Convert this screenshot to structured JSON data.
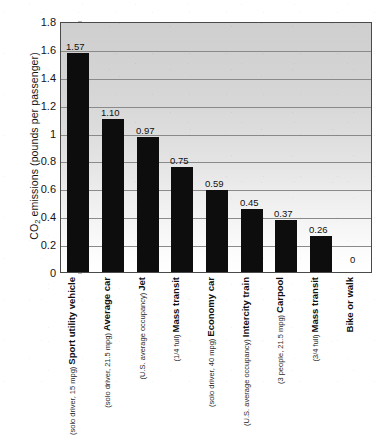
{
  "chart_data": {
    "type": "bar",
    "title": "",
    "subtitle": "",
    "xlabel": "",
    "ylabel": "CO2 emissions (pounds per passenger)",
    "ylabel_parts": {
      "prefix": "CO",
      "subscript": "2",
      "suffix": " emissions (pounds per passenger)"
    },
    "ylim": [
      0,
      1.8
    ],
    "ytick_labels": [
      "1.8",
      "1.6",
      "1.4",
      "1.2",
      "1",
      "0.8",
      "0.6",
      "0.4",
      "0.2",
      "0"
    ],
    "ytick_values": [
      1.8,
      1.6,
      1.4,
      1.2,
      1.0,
      0.8,
      0.6,
      0.4,
      0.2,
      0
    ],
    "grid": true,
    "grid_axis": "y",
    "legend": false,
    "legend_position": "none",
    "bar_color": "#0d0d0d",
    "categories": [
      "Sport utility vehicle",
      "Average car",
      "Jet",
      "Mass transit",
      "Economy car",
      "Intercity train",
      "Carpool",
      "Mass transit",
      "Bike or walk"
    ],
    "category_sublabels": [
      "(solo driver, 15 mpg)",
      "(solo driver, 21.5 mpg)",
      "(U.S. average occupancy)",
      "(1/4 full)",
      "(solo driver, 40 mpg)",
      "(U.S. average occupancy)",
      "(3 people, 21.5 mpg)",
      "(3/4 full)",
      ""
    ],
    "values": [
      1.57,
      1.1,
      0.97,
      0.75,
      0.59,
      0.45,
      0.37,
      0.26,
      0
    ],
    "value_labels": [
      "1.57",
      "1.10",
      "0.97",
      "0.75",
      "0.59",
      "0.45",
      "0.37",
      "0.26",
      "0"
    ]
  }
}
